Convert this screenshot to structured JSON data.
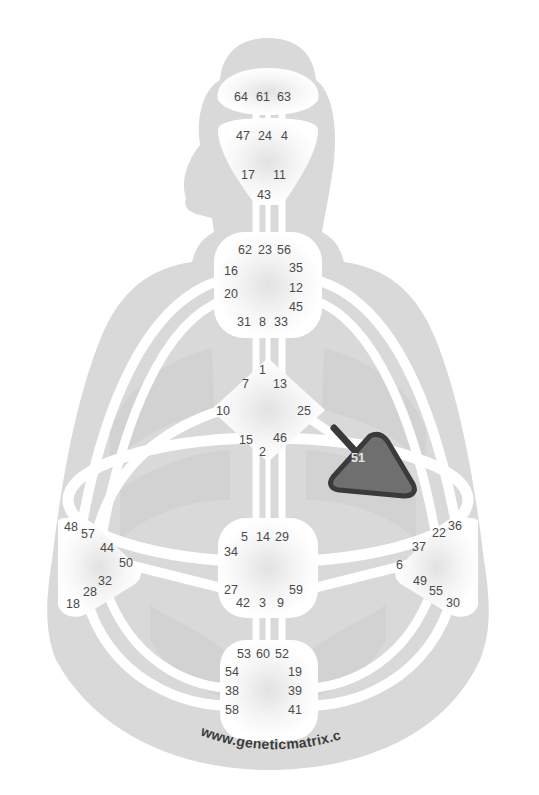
{
  "watermark": "www.geneticmatrix.com",
  "colors": {
    "silhouette": "#d9d9d9",
    "channel": "#ffffff",
    "center_fill": "#ffffff",
    "defined_center": "#6f6f6f",
    "defined_center_border": "#3a3a3a",
    "gate_text": "#4a4a4a"
  },
  "centers": {
    "head": {
      "name": "Head",
      "defined": false,
      "gates": [
        "64",
        "61",
        "63"
      ]
    },
    "ajna": {
      "name": "Ajna",
      "defined": false,
      "gates": [
        "47",
        "24",
        "4",
        "17",
        "11",
        "43"
      ]
    },
    "throat": {
      "name": "Throat",
      "defined": false,
      "gates": [
        "62",
        "23",
        "56",
        "16",
        "35",
        "20",
        "12",
        "45",
        "31",
        "8",
        "33"
      ]
    },
    "g": {
      "name": "G",
      "defined": false,
      "gates": [
        "1",
        "7",
        "13",
        "10",
        "25",
        "15",
        "46",
        "2"
      ]
    },
    "heart": {
      "name": "Heart",
      "defined": true,
      "gates": [
        "51",
        "26",
        "21",
        "40"
      ]
    },
    "sacral": {
      "name": "Sacral",
      "defined": false,
      "gates": [
        "5",
        "14",
        "29",
        "34",
        "27",
        "59",
        "42",
        "3",
        "9"
      ]
    },
    "spleen": {
      "name": "Spleen",
      "defined": false,
      "gates": [
        "48",
        "57",
        "44",
        "50",
        "32",
        "28",
        "18"
      ]
    },
    "solar_plexus": {
      "name": "Solar Plexus",
      "defined": false,
      "gates": [
        "36",
        "22",
        "37",
        "6",
        "49",
        "55",
        "30"
      ]
    },
    "root": {
      "name": "Root",
      "defined": false,
      "gates": [
        "53",
        "60",
        "52",
        "54",
        "19",
        "38",
        "39",
        "58",
        "41"
      ]
    }
  },
  "active_gates": [
    "51"
  ]
}
